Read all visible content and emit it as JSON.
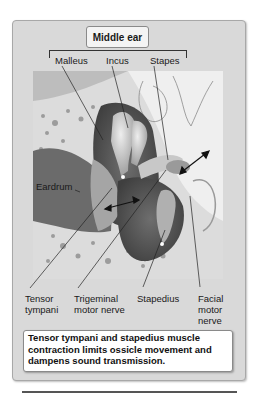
{
  "figure": {
    "title": "Middle ear",
    "top_labels": {
      "malleus": "Malleus",
      "incus": "Incus",
      "stapes": "Stapes"
    },
    "side_labels": {
      "eardrum": "Eardrum"
    },
    "bottom_labels": {
      "tensor_tympani_line1": "Tensor",
      "tensor_tympani_line2": "tympani",
      "trigeminal_line1": "Trigeminal",
      "trigeminal_line2": "motor nerve",
      "stapedius": "Stapedius",
      "facial_line1": "Facial",
      "facial_line2": "motor",
      "facial_line3": "nerve"
    },
    "caption": "Tensor tympani and stapedius muscle contraction limits ossicle movement and dampens sound transmission.",
    "colors": {
      "panel_bg": "#d9d9d9",
      "bone": "#e6e6e6",
      "muscle_dark": "#5a5a5a",
      "muscle_mid": "#7d7d7d",
      "ossicle": "#b8b8b8"
    }
  }
}
